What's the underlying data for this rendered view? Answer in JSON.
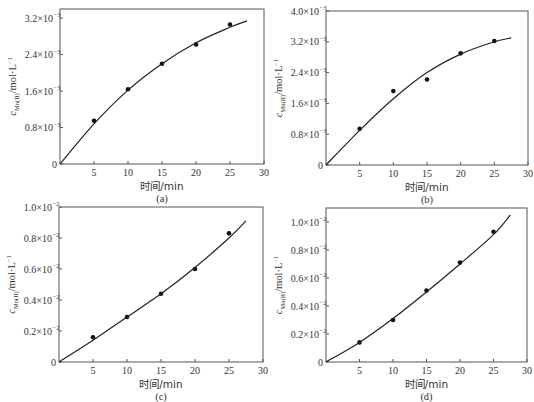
{
  "chart_data": [
    {
      "panel": "a",
      "caption": "(a)",
      "type": "scatter",
      "xlabel": "时间/min",
      "ylabel": "c_Mn(II)/mol·L⁻¹",
      "xlim": [
        0,
        30
      ],
      "ylim": [
        0,
        0.0034
      ],
      "xticks": [
        5,
        10,
        15,
        20,
        25,
        30
      ],
      "yticks": [
        0,
        0.0008,
        0.0016,
        0.0024,
        0.0032
      ],
      "ytick_labels": [
        {
          "mant": "0",
          "exp": ""
        },
        {
          "mant": "0.8×10",
          "exp": "−3"
        },
        {
          "mant": "1.6×10",
          "exp": "−3"
        },
        {
          "mant": "2.4×10",
          "exp": "−3"
        },
        {
          "mant": "3.2×10",
          "exp": "−3"
        }
      ],
      "series": [
        {
          "name": "measured",
          "x": [
            5,
            10,
            15,
            20,
            25
          ],
          "y": [
            0.00095,
            0.00164,
            0.0022,
            0.00262,
            0.00306
          ]
        },
        {
          "name": "fit",
          "style": "line",
          "x": [
            0,
            5,
            10,
            15,
            20,
            25,
            27.5
          ],
          "y": [
            0,
            0.00088,
            0.00162,
            0.0022,
            0.00266,
            0.003,
            0.00314
          ]
        }
      ]
    },
    {
      "panel": "b",
      "caption": "(b)",
      "type": "scatter",
      "xlabel": "时间/min",
      "ylabel": "c_Mn(II)/mol·L⁻¹",
      "xlim": [
        0,
        30
      ],
      "ylim": [
        0,
        0.004
      ],
      "xticks": [
        5,
        10,
        15,
        20,
        25,
        30
      ],
      "yticks": [
        0,
        0.0008,
        0.0016,
        0.0024,
        0.0032,
        0.004
      ],
      "ytick_labels": [
        {
          "mant": "0",
          "exp": ""
        },
        {
          "mant": "0.8×10",
          "exp": "−3"
        },
        {
          "mant": "1.6×10",
          "exp": "−3"
        },
        {
          "mant": "2.4×10",
          "exp": "−3"
        },
        {
          "mant": "3.2×10",
          "exp": "−3"
        },
        {
          "mant": "4.0×10",
          "exp": "−3"
        }
      ],
      "series": [
        {
          "name": "measured",
          "x": [
            5,
            10,
            15,
            20,
            25
          ],
          "y": [
            0.00094,
            0.00192,
            0.00222,
            0.0029,
            0.00322
          ]
        },
        {
          "name": "fit",
          "style": "line",
          "x": [
            0,
            5,
            10,
            15,
            20,
            25,
            27.5
          ],
          "y": [
            0,
            0.0009,
            0.00172,
            0.0024,
            0.00288,
            0.0032,
            0.0033
          ]
        }
      ]
    },
    {
      "panel": "c",
      "caption": "(c)",
      "type": "scatter",
      "xlabel": "时间/min",
      "ylabel": "c_Mn(II)/mol·L⁻¹",
      "xlim": [
        0,
        30
      ],
      "ylim": [
        0,
        0.01
      ],
      "xticks": [
        5,
        10,
        15,
        20,
        25,
        30
      ],
      "yticks": [
        0,
        0.002,
        0.004,
        0.006,
        0.008,
        0.01
      ],
      "ytick_labels": [
        {
          "mant": "0",
          "exp": ""
        },
        {
          "mant": "0.2×10",
          "exp": "−2"
        },
        {
          "mant": "0.4×10",
          "exp": "−2"
        },
        {
          "mant": "0.6×10",
          "exp": "−2"
        },
        {
          "mant": "0.8×10",
          "exp": "−2"
        },
        {
          "mant": "1.0×10",
          "exp": "−2"
        }
      ],
      "series": [
        {
          "name": "measured",
          "x": [
            5,
            10,
            15,
            20,
            25
          ],
          "y": [
            0.0016,
            0.0029,
            0.0044,
            0.006,
            0.0083
          ]
        },
        {
          "name": "fit",
          "style": "line",
          "x": [
            0,
            5,
            10,
            15,
            20,
            25,
            27.5
          ],
          "y": [
            0,
            0.0014,
            0.0029,
            0.0044,
            0.0061,
            0.008,
            0.0091
          ]
        }
      ]
    },
    {
      "panel": "d",
      "caption": "(d)",
      "type": "scatter",
      "xlabel": "时间/min",
      "ylabel": "c_Mn(II)/mol·L⁻¹",
      "xlim": [
        0,
        30
      ],
      "ylim": [
        0,
        0.011
      ],
      "xticks": [
        5,
        10,
        15,
        20,
        25,
        30
      ],
      "yticks": [
        0,
        0.002,
        0.004,
        0.006,
        0.008,
        0.01
      ],
      "ytick_labels": [
        {
          "mant": "0",
          "exp": ""
        },
        {
          "mant": "0.2×10",
          "exp": "−2"
        },
        {
          "mant": "0.4×10",
          "exp": "−2"
        },
        {
          "mant": "0.6×10",
          "exp": "−2"
        },
        {
          "mant": "0.8×10",
          "exp": "−2"
        },
        {
          "mant": "1.0×10",
          "exp": "−2"
        }
      ],
      "series": [
        {
          "name": "measured",
          "x": [
            5,
            10,
            15,
            20,
            25
          ],
          "y": [
            0.0014,
            0.003,
            0.0051,
            0.0071,
            0.0093
          ]
        },
        {
          "name": "fit",
          "style": "line",
          "x": [
            0,
            5,
            10,
            15,
            20,
            25,
            27.5
          ],
          "y": [
            0,
            0.0014,
            0.0031,
            0.005,
            0.007,
            0.0091,
            0.0105
          ]
        }
      ]
    }
  ],
  "layout": {
    "panels": [
      {
        "x0": 60,
        "x1": 264,
        "y0": 9,
        "y1": 164
      },
      {
        "x0": 326,
        "x1": 528,
        "y0": 11,
        "y1": 165
      },
      {
        "x0": 59,
        "x1": 263,
        "y0": 207,
        "y1": 362
      },
      {
        "x0": 326,
        "x1": 527,
        "y0": 208,
        "y1": 362
      }
    ]
  }
}
